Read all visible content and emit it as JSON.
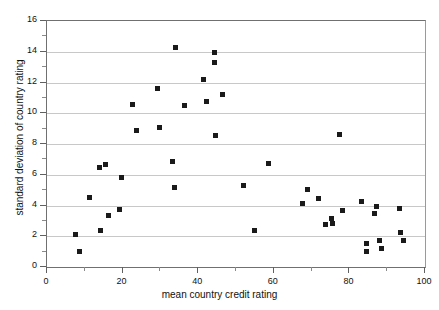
{
  "chart_data": {
    "type": "scatter",
    "title": "",
    "xlabel": "mean country credit rating",
    "ylabel": "standard deviation of country rating",
    "xlim": [
      0,
      100
    ],
    "ylim": [
      0,
      16
    ],
    "xticks": [
      0,
      20,
      40,
      60,
      80,
      100
    ],
    "xticks_minor": [
      10,
      30,
      50,
      70,
      90
    ],
    "yticks": [
      0,
      2,
      4,
      6,
      8,
      10,
      12,
      14,
      16
    ],
    "yticks_minor": [
      1,
      3,
      5,
      7,
      9,
      11,
      13,
      15
    ],
    "grid": "horizontal",
    "legend": "none",
    "marker": "square",
    "marker_color": "#1a1a1a",
    "points": [
      {
        "x": 7.5,
        "y": 2.1
      },
      {
        "x": 8.7,
        "y": 1.0
      },
      {
        "x": 11.3,
        "y": 4.5
      },
      {
        "x": 13.8,
        "y": 6.45
      },
      {
        "x": 14.2,
        "y": 2.4
      },
      {
        "x": 15.6,
        "y": 6.65
      },
      {
        "x": 16.2,
        "y": 3.35
      },
      {
        "x": 19.3,
        "y": 3.75
      },
      {
        "x": 19.6,
        "y": 5.8
      },
      {
        "x": 22.5,
        "y": 10.55
      },
      {
        "x": 23.7,
        "y": 8.9
      },
      {
        "x": 29.3,
        "y": 11.6
      },
      {
        "x": 29.8,
        "y": 9.1
      },
      {
        "x": 33.3,
        "y": 6.85
      },
      {
        "x": 33.6,
        "y": 5.15
      },
      {
        "x": 33.9,
        "y": 14.25
      },
      {
        "x": 36.3,
        "y": 10.5
      },
      {
        "x": 41.5,
        "y": 12.2
      },
      {
        "x": 42.1,
        "y": 10.75
      },
      {
        "x": 44.2,
        "y": 13.95
      },
      {
        "x": 44.4,
        "y": 13.3
      },
      {
        "x": 44.6,
        "y": 8.55
      },
      {
        "x": 46.3,
        "y": 11.2
      },
      {
        "x": 52.0,
        "y": 5.3
      },
      {
        "x": 54.8,
        "y": 2.35
      },
      {
        "x": 58.6,
        "y": 6.7
      },
      {
        "x": 67.5,
        "y": 4.15
      },
      {
        "x": 69.0,
        "y": 5.05
      },
      {
        "x": 71.8,
        "y": 4.45
      },
      {
        "x": 73.8,
        "y": 2.75
      },
      {
        "x": 75.2,
        "y": 3.15
      },
      {
        "x": 75.6,
        "y": 2.8
      },
      {
        "x": 77.5,
        "y": 8.6
      },
      {
        "x": 78.2,
        "y": 3.65
      },
      {
        "x": 83.2,
        "y": 4.25
      },
      {
        "x": 84.5,
        "y": 1.55
      },
      {
        "x": 84.6,
        "y": 1.0
      },
      {
        "x": 86.7,
        "y": 3.5
      },
      {
        "x": 87.2,
        "y": 3.95
      },
      {
        "x": 88.0,
        "y": 1.7
      },
      {
        "x": 88.4,
        "y": 1.2
      },
      {
        "x": 93.3,
        "y": 3.8
      },
      {
        "x": 93.6,
        "y": 2.25
      },
      {
        "x": 94.2,
        "y": 1.7
      }
    ]
  }
}
